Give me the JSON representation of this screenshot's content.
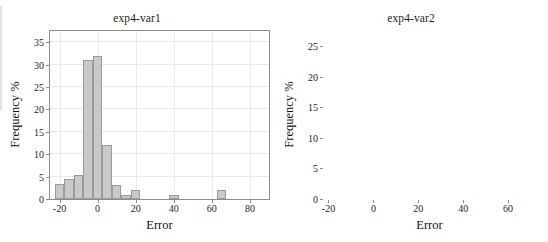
{
  "document": {
    "cut_header_text": "",
    "background_color": "#ffffff"
  },
  "style": {
    "bar_fill": "#c9c9c9",
    "bar_stroke": "#9a9a9a",
    "grid_color": "#e9e9ec",
    "frame_color": "#8e8e8e",
    "text_color": "#1d1d1d"
  },
  "panels": [
    {
      "id": "exp4-var1",
      "title": "exp4-var1",
      "xlabel": "Error",
      "ylabel": "Frequency %"
    },
    {
      "id": "exp4-var2",
      "title": "exp4-var2",
      "xlabel": "Error",
      "ylabel": "Frequency %"
    }
  ],
  "chart_data": [
    {
      "type": "bar",
      "title": "exp4-var1",
      "xlabel": "Error",
      "ylabel": "Frequency %",
      "grid": true,
      "legend": "none",
      "xlim": [
        -25,
        90
      ],
      "ylim": [
        0,
        37.5
      ],
      "xticks": [
        -20,
        0,
        20,
        40,
        60,
        80
      ],
      "xtick_labels": [
        "-20",
        "0",
        "20",
        "40",
        "60",
        "80"
      ],
      "yticks": [
        0,
        5,
        10,
        15,
        20,
        25,
        30,
        35
      ],
      "ytick_labels": [
        "0",
        "5",
        "10",
        "15",
        "20",
        "25",
        "30",
        "35"
      ],
      "bin_width": 5,
      "bin_starts": [
        -22.5,
        -17.5,
        -12.5,
        -7.5,
        -2.5,
        2.5,
        7.5,
        12.5,
        17.5,
        37.5,
        62.5
      ],
      "categories": [
        "-22.5",
        "-17.5",
        "-12.5",
        "-7.5",
        "-2.5",
        "2.5",
        "7.5",
        "12.5",
        "17.5",
        "37.5",
        "62.5"
      ],
      "values": [
        3.3,
        4.4,
        5.4,
        31.0,
        32.0,
        12.1,
        3.2,
        1.0,
        2.1,
        1.0,
        2.0
      ]
    },
    {
      "type": "bar",
      "title": "exp4-var2",
      "xlabel": "Error",
      "ylabel": "Frequency %",
      "grid": true,
      "legend": "none",
      "xlim": [
        -22,
        72
      ],
      "ylim": [
        0,
        27.5
      ],
      "xticks": [
        -20,
        0,
        20,
        40,
        60
      ],
      "xtick_labels": [
        "-20",
        "0",
        "20",
        "40",
        "60"
      ],
      "yticks": [
        0,
        5,
        10,
        15,
        20,
        25
      ],
      "ytick_labels": [
        "0",
        "5",
        "10",
        "15",
        "20",
        "25"
      ],
      "bin_width": 5,
      "bin_starts": [
        -17.5,
        -12.5,
        -7.5,
        -2.5,
        2.5,
        7.5,
        12.5,
        17.5,
        22.5,
        32.5,
        42.5,
        47.5
      ],
      "categories": [
        "-17.5",
        "-12.5",
        "-7.5",
        "-2.5",
        "2.5",
        "7.5",
        "12.5",
        "17.5",
        "22.5",
        "32.5",
        "42.5",
        "47.5"
      ],
      "values": [
        1.2,
        5.1,
        22.3,
        22.2,
        23.6,
        10.4,
        1.2,
        2.5,
        2.4,
        1.0,
        3.8,
        1.2
      ]
    }
  ]
}
